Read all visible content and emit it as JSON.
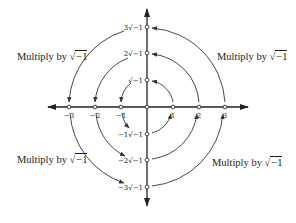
{
  "diagram": {
    "real_axis": {
      "points": [
        {
          "value": -3,
          "label": "−3"
        },
        {
          "value": -2,
          "label": "−2"
        },
        {
          "value": -1,
          "label": "−1"
        },
        {
          "value": 0,
          "label": ""
        },
        {
          "value": 1,
          "label": "1"
        },
        {
          "value": 2,
          "label": "2"
        },
        {
          "value": 3,
          "label": "3"
        }
      ]
    },
    "imaginary_axis": {
      "points": [
        {
          "value": 3,
          "label": "3√−1"
        },
        {
          "value": 2,
          "label": "2√−1"
        },
        {
          "value": 1,
          "label": "√−1"
        },
        {
          "value": -1,
          "label": "−1√−1"
        },
        {
          "value": -2,
          "label": "−2√−1"
        },
        {
          "value": -3,
          "label": "−3√−1"
        }
      ]
    },
    "annotations": {
      "top_left": {
        "prefix": "Multiply by ",
        "radical": "√",
        "radicand": "−1"
      },
      "top_right": {
        "prefix": "Multiply by ",
        "radical": "√",
        "radicand": "−1"
      },
      "bottom_left": {
        "prefix": "Multiply by ",
        "radical": "√",
        "radicand": "−1"
      },
      "bottom_right": {
        "prefix": "Multiply by ",
        "radical": "√",
        "radicand": "−1"
      }
    },
    "arcs": {
      "direction": "counter-clockwise",
      "radii": [
        1,
        2,
        3
      ],
      "quadrants": [
        "I",
        "II",
        "III",
        "IV"
      ]
    },
    "colors": {
      "axis": "#222222",
      "arc": "#333333",
      "text": "#1a1a1a",
      "background": "#ffffff"
    }
  }
}
